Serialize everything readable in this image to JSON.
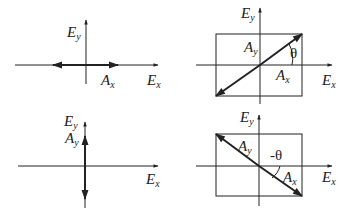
{
  "diagram": {
    "panels": [
      {
        "id": "horizontal",
        "axes": {
          "x_label": "E",
          "x_sub": "x",
          "y_label": "E",
          "y_sub": "y"
        },
        "amplitude_label": {
          "main": "A",
          "sub": "x"
        },
        "description": "Linear polarization along Ex (double arrow on horizontal axis)"
      },
      {
        "id": "diagonal-positive",
        "axes": {
          "x_label": "E",
          "x_sub": "x",
          "y_label": "E",
          "y_sub": "y"
        },
        "labels": [
          {
            "main": "A",
            "sub": "y"
          },
          {
            "main": "A",
            "sub": "x"
          }
        ],
        "angle_label": "θ",
        "description": "Linear polarization at +θ inside Ax×Ay rectangle"
      },
      {
        "id": "vertical",
        "axes": {
          "x_label": "E",
          "x_sub": "x",
          "y_label": "E",
          "y_sub": "y"
        },
        "amplitude_label": {
          "main": "A",
          "sub": "y"
        },
        "description": "Linear polarization along Ey (double arrow on vertical axis)"
      },
      {
        "id": "diagonal-negative",
        "axes": {
          "x_label": "E",
          "x_sub": "x",
          "y_label": "E",
          "y_sub": "y"
        },
        "labels": [
          {
            "main": "A",
            "sub": "y"
          },
          {
            "main": "A",
            "sub": "x"
          }
        ],
        "angle_label": "-θ",
        "description": "Linear polarization at -θ inside Ax×Ay rectangle"
      }
    ],
    "colors": {
      "stroke": "#222222",
      "background": "#ffffff"
    }
  }
}
